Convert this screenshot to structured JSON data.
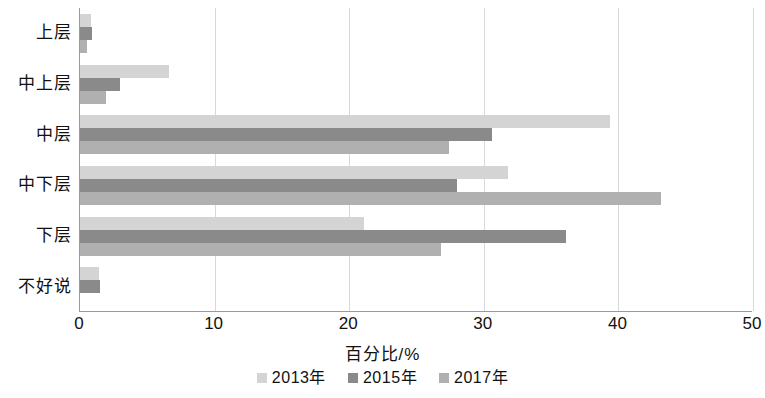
{
  "chart_data": {
    "type": "bar",
    "orientation": "horizontal",
    "title": "",
    "xlabel": "百分比/%",
    "ylabel": "",
    "xlim": [
      0,
      50
    ],
    "xticks": [
      0,
      10,
      20,
      30,
      40,
      50
    ],
    "xtick_labels": [
      "0",
      "10",
      "20",
      "30",
      "40",
      "50"
    ],
    "grid": true,
    "grid_axis": "x",
    "legend_position": "bottom",
    "categories": [
      "上层",
      "中上层",
      "中层",
      "中下层",
      "下层",
      "不好说"
    ],
    "series": [
      {
        "name": "2013年",
        "color": "#d4d4d4",
        "values": [
          0.8,
          6.6,
          39.4,
          31.8,
          21.1,
          1.4
        ]
      },
      {
        "name": "2015年",
        "color": "#8a8a8a",
        "values": [
          0.9,
          3.0,
          30.6,
          28.0,
          36.1,
          1.5
        ]
      },
      {
        "name": "2017年",
        "color": "#b0b0b0",
        "values": [
          0.5,
          1.9,
          27.4,
          43.2,
          26.8,
          0.0
        ]
      }
    ]
  }
}
